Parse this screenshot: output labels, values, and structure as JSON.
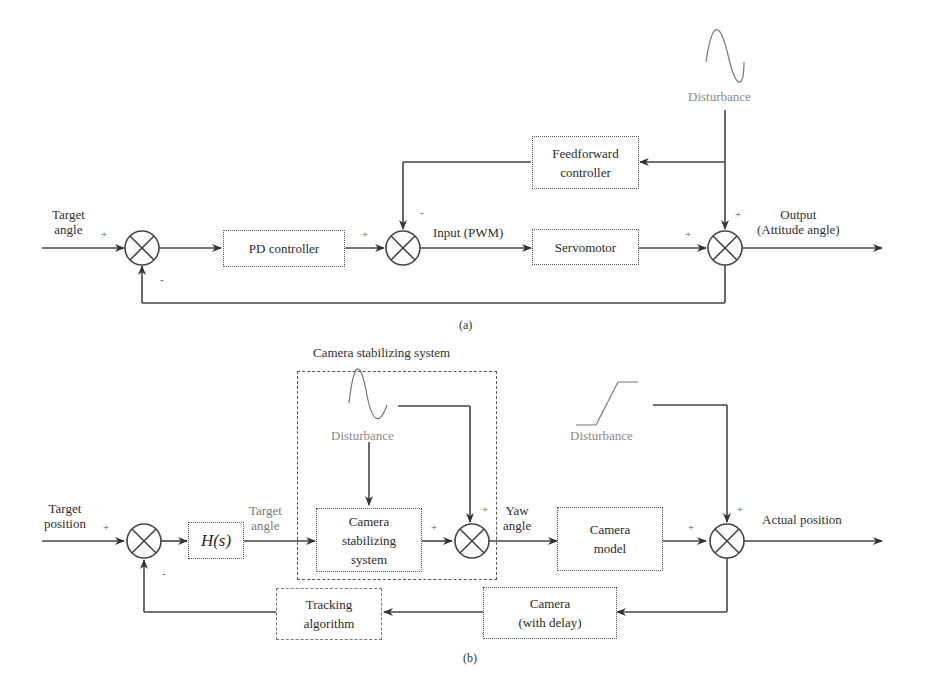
{
  "diagram_a": {
    "caption": "(a)",
    "inputs": {
      "target_angle": "Target\nangle",
      "target_angle_l1": "Target",
      "target_angle_l2": "angle"
    },
    "blocks": {
      "pd_controller": "PD controller",
      "feedforward_l1": "Feedforward",
      "feedforward_l2": "controller",
      "servomotor": "Servomotor"
    },
    "signals": {
      "input_pwm": "Input (PWM)",
      "disturbance": "Disturbance",
      "output_l1": "Output",
      "output_l2": "(Attitude angle)"
    },
    "signs": {
      "sum1_in": "+",
      "sum1_fb": "-",
      "sum2_in": "+",
      "sum2_ff": "-",
      "sum3_in": "+",
      "sum3_dist": "+"
    }
  },
  "diagram_b": {
    "caption": "(b)",
    "group_title": "Camera stabilizing system",
    "inputs": {
      "target_position_l1": "Target",
      "target_position_l2": "position"
    },
    "blocks": {
      "h_s": "H(s)",
      "stab_l1": "Camera",
      "stab_l2": "stabilizing",
      "stab_l3": "system",
      "camera_model_l1": "Camera",
      "camera_model_l2": "model",
      "camera_delay_l1": "Camera",
      "camera_delay_l2": "(with delay)",
      "tracking_l1": "Tracking",
      "tracking_l2": "algorithm"
    },
    "signals": {
      "target_angle_l1": "Target",
      "target_angle_l2": "angle",
      "disturbance_sine": "Disturbance",
      "yaw_angle_l1": "Yaw",
      "yaw_angle_l2": "angle",
      "disturbance_ramp": "Disturbance",
      "actual_position": "Actual position"
    },
    "signs": {
      "sum1_in": "+",
      "sum1_fb": "-",
      "sum2_in": "+",
      "sum2_dist": "+",
      "sum3_in": "+",
      "sum3_dist": "+"
    }
  }
}
